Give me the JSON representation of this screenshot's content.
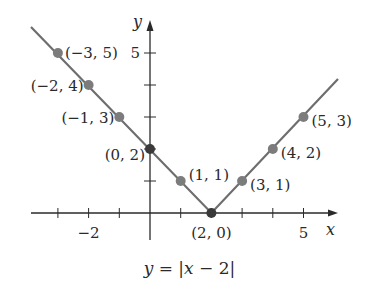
{
  "chart_data": {
    "type": "line",
    "title": "",
    "caption": "y = |x − 2|",
    "xlabel": "x",
    "ylabel": "y",
    "xlim": [
      -4,
      6
    ],
    "ylim": [
      -1,
      6
    ],
    "x_ticks": [
      -3,
      -2,
      -1,
      0,
      1,
      2,
      3,
      4,
      5
    ],
    "x_tick_labels": {
      "-2": "−2",
      "5": "5"
    },
    "y_ticks": [
      1,
      2,
      3,
      4,
      5
    ],
    "y_tick_labels": {
      "5": "5"
    },
    "grid": false,
    "legend": null,
    "function": "y = |x - 2|",
    "line_x": [
      -4,
      2,
      6.2
    ],
    "line_y": [
      6,
      0,
      4.2
    ],
    "points": [
      {
        "x": -3,
        "y": 5,
        "label": "(−3, 5)"
      },
      {
        "x": -2,
        "y": 4,
        "label": "(−2, 4)"
      },
      {
        "x": -1,
        "y": 3,
        "label": "(−1, 3)"
      },
      {
        "x": 0,
        "y": 2,
        "label": "(0, 2)"
      },
      {
        "x": 1,
        "y": 1,
        "label": "(1, 1)"
      },
      {
        "x": 2,
        "y": 0,
        "label": "(2, 0)"
      },
      {
        "x": 3,
        "y": 1,
        "label": "(3, 1)"
      },
      {
        "x": 4,
        "y": 2,
        "label": "(4, 2)"
      },
      {
        "x": 5,
        "y": 3,
        "label": "(5, 3)"
      }
    ],
    "colors": {
      "line": "#6e6e6e",
      "point": "#7c7c7c",
      "vertex_point": "#3a3a3a",
      "axis": "#2a2a2a"
    }
  },
  "caption_parts": {
    "lhs": "y",
    "eq": " = |",
    "var": "x",
    "rest": " − 2|"
  }
}
